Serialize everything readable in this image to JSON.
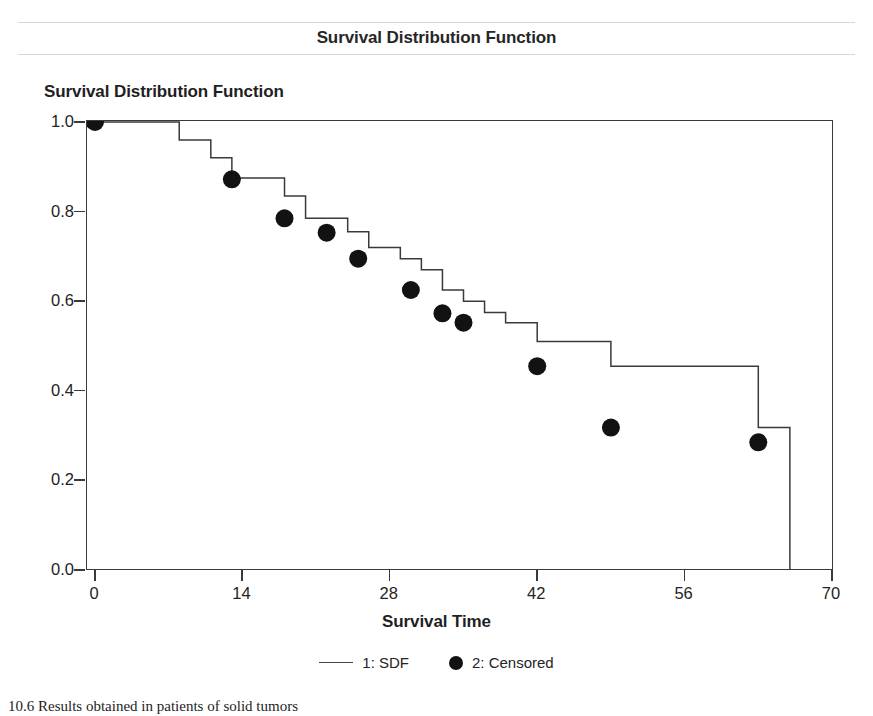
{
  "page": {
    "header_title": "Survival Distribution Function",
    "caption": "10.6 Results obtained in patients of solid tumors"
  },
  "chart_data": {
    "type": "line",
    "subtype": "kaplan-meier-step",
    "title": "Survival Distribution Function",
    "xlabel": "Survival Time",
    "ylabel": "",
    "xlim": [
      0,
      70
    ],
    "ylim": [
      0.0,
      1.0
    ],
    "xticks": [
      0,
      14,
      28,
      42,
      56,
      70
    ],
    "xtick_labels": [
      "0",
      "14",
      "28",
      "42",
      "56",
      "70"
    ],
    "yticks": [
      0.0,
      0.2,
      0.4,
      0.6,
      0.8,
      1.0
    ],
    "ytick_labels": [
      "0.0",
      "0.2",
      "0.4",
      "0.6",
      "0.8",
      "1.0"
    ],
    "grid": false,
    "legend_position": "bottom",
    "legend": [
      {
        "key": "1",
        "label": "1: SDF",
        "marker": "line"
      },
      {
        "key": "2",
        "label": "2: Censored",
        "marker": "circle"
      }
    ],
    "series": [
      {
        "name": "1: SDF",
        "style": "step-post",
        "color": "#3a3a3a",
        "x": [
          0,
          4,
          8,
          11,
          13,
          16,
          18,
          20,
          22,
          24,
          26,
          29,
          31,
          33,
          35,
          37,
          39,
          42,
          49,
          63,
          66
        ],
        "y": [
          1.0,
          1.0,
          0.96,
          0.92,
          0.875,
          0.875,
          0.835,
          0.785,
          0.785,
          0.755,
          0.72,
          0.695,
          0.67,
          0.625,
          0.6,
          0.575,
          0.552,
          0.51,
          0.455,
          0.318,
          0.285
        ]
      }
    ],
    "censored_points": [
      {
        "time": 0,
        "survival": 1.0
      },
      {
        "time": 13,
        "survival": 0.872
      },
      {
        "time": 18,
        "survival": 0.785
      },
      {
        "time": 22,
        "survival": 0.753
      },
      {
        "time": 25,
        "survival": 0.695
      },
      {
        "time": 30,
        "survival": 0.625
      },
      {
        "time": 33,
        "survival": 0.573
      },
      {
        "time": 35,
        "survival": 0.552
      },
      {
        "time": 42,
        "survival": 0.455
      },
      {
        "time": 49,
        "survival": 0.318
      },
      {
        "time": 63,
        "survival": 0.285
      }
    ],
    "terminal_drop": {
      "time": 66,
      "from": 0.285,
      "to": 0.0
    },
    "marker_color": "#121212",
    "axis_color": "#3a3a3a"
  }
}
